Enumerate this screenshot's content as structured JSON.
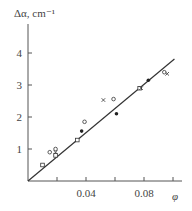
{
  "chart_data": {
    "type": "scatter",
    "title": "",
    "ylabel": "Δα, cm⁻¹",
    "xlabel": "φ",
    "xlim": [
      0,
      0.104
    ],
    "ylim": [
      0,
      4.7
    ],
    "x_ticks": [
      0.02,
      0.04,
      0.06,
      0.08,
      0.1
    ],
    "x_tick_labels": [
      "",
      "0.04",
      "",
      "0.08",
      ""
    ],
    "y_ticks": [
      1,
      2,
      3,
      4
    ],
    "y_tick_labels": [
      "1",
      "2",
      "3",
      "4"
    ],
    "grid": false,
    "legend": null,
    "series": [
      {
        "name": "open-circles",
        "marker": "circle-open",
        "points": [
          [
            0.015,
            0.9
          ],
          [
            0.019,
            1.0
          ],
          [
            0.039,
            1.85
          ],
          [
            0.059,
            2.56
          ],
          [
            0.094,
            3.4
          ]
        ]
      },
      {
        "name": "filled-circles",
        "marker": "circle-filled",
        "points": [
          [
            0.037,
            1.56
          ],
          [
            0.061,
            2.1
          ],
          [
            0.083,
            3.15
          ]
        ]
      },
      {
        "name": "squares",
        "marker": "square-open",
        "points": [
          [
            0.01,
            0.5
          ],
          [
            0.019,
            0.8
          ],
          [
            0.034,
            1.28
          ],
          [
            0.077,
            2.9
          ]
        ]
      },
      {
        "name": "crosses",
        "marker": "cross",
        "points": [
          [
            0.019,
            0.9
          ],
          [
            0.052,
            2.53
          ],
          [
            0.078,
            2.9
          ],
          [
            0.096,
            3.35
          ]
        ]
      }
    ],
    "fit_line": {
      "name": "linear-fit",
      "from": [
        0,
        0
      ],
      "to": [
        0.101,
        3.81
      ]
    }
  }
}
